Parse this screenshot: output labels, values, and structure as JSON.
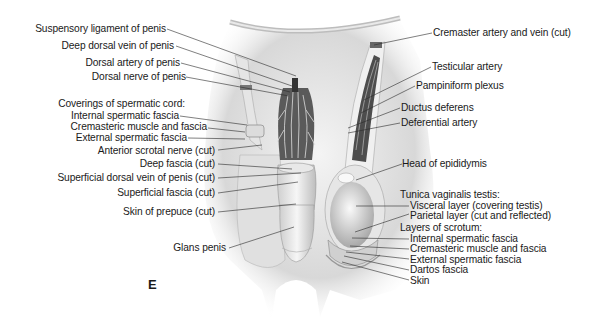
{
  "figure": {
    "panel_letter": "E",
    "colors": {
      "background": "#ffffff",
      "text": "#1a1a1a",
      "leader": "#2a2a2a",
      "tissue_light": "#ededed",
      "tissue_mid": "#c9c9c9",
      "tissue_dark": "#4a4a4a"
    }
  },
  "labels_left": {
    "suspensory_ligament": "Suspensory ligament of penis",
    "deep_dorsal_vein": "Deep dorsal vein of penis",
    "dorsal_artery": "Dorsal artery of penis",
    "dorsal_nerve": "Dorsal nerve of penis",
    "coverings_heading": "Coverings of spermatic cord:",
    "internal_spermatic_fascia": "Internal spermatic fascia",
    "cremasteric_muscle": "Cremasteric muscle and fascia",
    "external_spermatic_fascia": "External spermatic fascia",
    "anterior_scrotal_nerve": "Anterior scrotal nerve (cut)",
    "deep_fascia": "Deep fascia (cut)",
    "superficial_dorsal_vein": "Superficial dorsal vein of penis (cut)",
    "superficial_fascia": "Superficial fascia (cut)",
    "skin_of_prepuce": "Skin of prepuce (cut)",
    "glans_penis": "Glans penis"
  },
  "labels_right": {
    "cremaster_artery": "Cremaster artery and vein (cut)",
    "testicular_artery": "Testicular artery",
    "pampiniform_plexus": "Pampiniform plexus",
    "ductus_deferens": "Ductus deferens",
    "deferential_artery": "Deferential artery",
    "head_of_epididymis": "Head of epididymis",
    "tunica_heading": "Tunica vaginalis testis:",
    "visceral_layer": "Visceral layer (covering testis)",
    "parietal_layer": "Parietal layer (cut and reflected)",
    "scrotum_heading": "Layers of scrotum:",
    "scrotum_internal_spermatic": "Internal spermatic fascia",
    "scrotum_cremasteric": "Cremasteric muscle and fascia",
    "scrotum_external_spermatic": "External spermatic fascia",
    "dartos_fascia": "Dartos fascia",
    "skin": "Skin"
  }
}
